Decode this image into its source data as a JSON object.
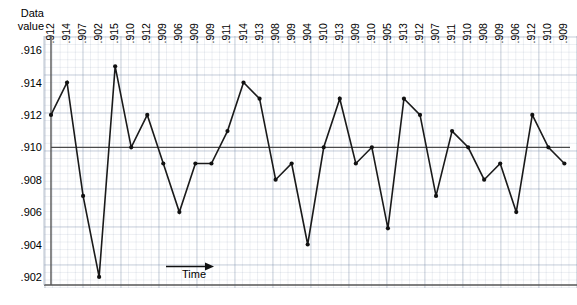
{
  "chart_data": {
    "type": "line",
    "title": "",
    "xlabel": "Time",
    "ylabel": "Data value",
    "ylim": [
      0.902,
      0.916
    ],
    "yticks": [
      ".916",
      ".914",
      ".912",
      ".910",
      ".908",
      ".906",
      ".904",
      ".902"
    ],
    "ytick_values": [
      0.916,
      0.914,
      0.912,
      0.91,
      0.908,
      0.906,
      0.904,
      0.902
    ],
    "grid": true,
    "legend": "none",
    "reference_line": 0.91,
    "marker": "filled-circle",
    "line_color": "#1a1a1a",
    "grid_color": "#6e82a0",
    "categories": [
      ".912",
      ".914",
      ".907",
      ".902",
      ".915",
      ".910",
      ".912",
      ".909",
      ".906",
      ".909",
      ".909",
      ".911",
      ".914",
      ".913",
      ".908",
      ".909",
      ".904",
      ".910",
      ".913",
      ".909",
      ".910",
      ".905",
      ".913",
      ".912",
      ".907",
      ".911",
      ".910",
      ".908",
      ".909",
      ".906",
      ".912",
      ".910",
      ".909"
    ],
    "values": [
      0.912,
      0.914,
      0.907,
      0.902,
      0.915,
      0.91,
      0.912,
      0.909,
      0.906,
      0.909,
      0.909,
      0.911,
      0.914,
      0.913,
      0.908,
      0.909,
      0.904,
      0.91,
      0.913,
      0.909,
      0.91,
      0.905,
      0.913,
      0.912,
      0.907,
      0.911,
      0.91,
      0.908,
      0.909,
      0.906,
      0.912,
      0.91,
      0.909
    ]
  },
  "axis": {
    "y_title_line1": "Data",
    "y_title_line2": "value"
  },
  "xaxis": {
    "label": "Time",
    "arrow_icon": "right-arrow-icon"
  }
}
